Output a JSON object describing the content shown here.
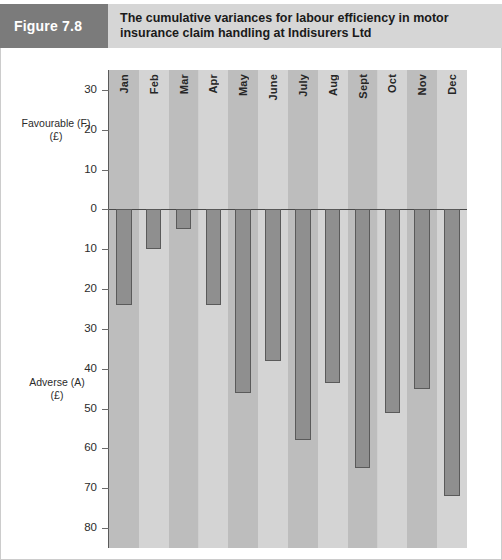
{
  "header": {
    "figure_tag": "Figure 7.8",
    "title_line1": "The cumulative variances for labour efficiency in motor",
    "title_line2": "insurance claim handling at Indisurers Ltd",
    "tag_bg": "#7b7b7b",
    "band_bg": "#d6d6d6"
  },
  "axis": {
    "favourable_label_line1": "Favourable (F)",
    "favourable_label_line2": "(£)",
    "adverse_label_line1": "Adverse (A)",
    "adverse_label_line2": "(£)"
  },
  "chart_data": {
    "type": "bar",
    "title": "The cumulative variances for labour efficiency in motor insurance claim handling at Indisurers Ltd",
    "xlabel": "",
    "ylabel": "£",
    "categories": [
      "Jan",
      "Feb",
      "Mar",
      "Apr",
      "May",
      "June",
      "July",
      "Aug",
      "Sept",
      "Oct",
      "Nov",
      "Dec"
    ],
    "values": [
      -24,
      -10,
      -5,
      -24,
      -46,
      -38,
      -58,
      -43.5,
      -65,
      -51,
      -45,
      -72
    ],
    "tick_labels": [
      "30",
      "20",
      "10",
      "0",
      "10",
      "20",
      "30",
      "40",
      "50",
      "60",
      "70",
      "80"
    ],
    "tick_values": [
      30,
      20,
      10,
      0,
      -10,
      -20,
      -30,
      -40,
      -50,
      -60,
      -70,
      -80
    ],
    "ylim": [
      -85,
      35
    ],
    "grid": false,
    "legend": "none",
    "bar_color": "#8f8f8f",
    "bar_border_color": "#5a5a5a",
    "note": "Negative values are plotted below the zero line and labelled as Adverse (A); positive would be Favourable (F). Axis tick labels are shown unsigned."
  }
}
